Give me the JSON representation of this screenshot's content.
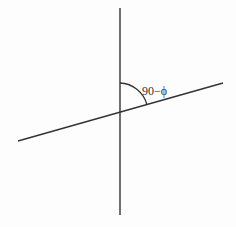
{
  "diagram": {
    "type": "angle-between-lines",
    "angle_label": "90−ϕ",
    "colors": {
      "background": "#fdfdfd",
      "line": "#333333",
      "text": "#333333"
    },
    "vertical_line": {
      "x": 120,
      "y1": 8,
      "y2": 215
    },
    "slanted_line": {
      "x1": 18,
      "y1": 141,
      "x2": 223,
      "y2": 83
    },
    "intersection": {
      "x": 120,
      "y": 112
    },
    "arc": {
      "start": [
        120,
        83
      ],
      "end": [
        147,
        105
      ]
    }
  }
}
